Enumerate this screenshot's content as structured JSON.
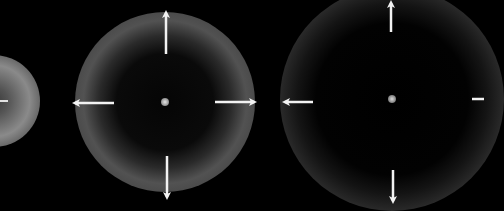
{
  "figure": {
    "background": "#000000",
    "arrow_color": "#f2f2f2",
    "panels": [
      {
        "id": "stage-1",
        "center": [
          -6,
          101
        ],
        "inner_radius": 10,
        "ring_radius": 30,
        "outer_radius": 42,
        "ring_brightness": "#8a8a8a",
        "arrows": [
          "right-stub"
        ]
      },
      {
        "id": "stage-2",
        "center": [
          165,
          102
        ],
        "inner_radius": 40,
        "ring_radius": 58,
        "outer_radius": 90,
        "ring_brightness": "#5a5a5a",
        "arrows": [
          "up",
          "down",
          "left",
          "right"
        ]
      },
      {
        "id": "stage-3",
        "center": [
          392,
          99
        ],
        "inner_radius": 60,
        "ring_radius": 80,
        "outer_radius": 112,
        "ring_brightness": "#2e2e2e",
        "arrows": [
          "up",
          "down",
          "left",
          "right-stub"
        ]
      }
    ]
  }
}
